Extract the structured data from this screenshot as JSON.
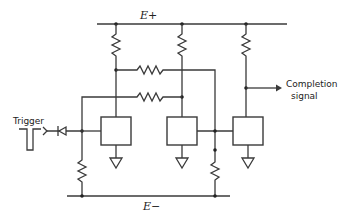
{
  "diagram": {
    "labels": {
      "positive_rail": "E+",
      "negative_rail": "E−",
      "trigger": "Trigger",
      "completion_line1": "Completion",
      "completion_line2": "signal"
    },
    "components": {
      "boxes": 3,
      "resistors": 7,
      "diodes": 1,
      "grounds": 3
    },
    "colors": {
      "line": "#3a3a3a",
      "background": "#ffffff"
    }
  }
}
